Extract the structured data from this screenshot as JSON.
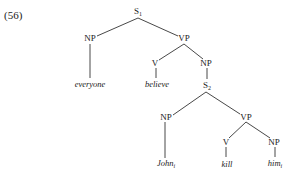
{
  "example_number": "(56)",
  "tree": {
    "nodes": [
      {
        "id": "S1",
        "label": "S",
        "sub": "1",
        "x": 138,
        "y": 12,
        "type": "cat"
      },
      {
        "id": "NP1",
        "label": "NP",
        "sub": "",
        "x": 90,
        "y": 38,
        "type": "cat"
      },
      {
        "id": "everyone",
        "label": "everyone",
        "sub": "",
        "x": 90,
        "y": 84,
        "type": "word"
      },
      {
        "id": "VP1",
        "label": "VP",
        "sub": "",
        "x": 184,
        "y": 38,
        "type": "cat"
      },
      {
        "id": "V1",
        "label": "V",
        "sub": "",
        "x": 155,
        "y": 63,
        "type": "cat"
      },
      {
        "id": "believe",
        "label": "believe",
        "sub": "",
        "x": 157,
        "y": 84,
        "type": "word"
      },
      {
        "id": "NP2",
        "label": "NP",
        "sub": "",
        "x": 206,
        "y": 63,
        "type": "cat"
      },
      {
        "id": "S2",
        "label": "S",
        "sub": "2",
        "x": 207,
        "y": 86,
        "type": "cat"
      },
      {
        "id": "NP3",
        "label": "NP",
        "sub": "",
        "x": 166,
        "y": 117,
        "type": "cat"
      },
      {
        "id": "John",
        "label": "John",
        "sub": "i",
        "x": 166,
        "y": 164,
        "type": "word"
      },
      {
        "id": "VP2",
        "label": "VP",
        "sub": "",
        "x": 246,
        "y": 117,
        "type": "cat"
      },
      {
        "id": "V2",
        "label": "V",
        "sub": "",
        "x": 226,
        "y": 142,
        "type": "cat"
      },
      {
        "id": "kill",
        "label": "kill",
        "sub": "",
        "x": 227,
        "y": 164,
        "type": "word"
      },
      {
        "id": "NP4",
        "label": "NP",
        "sub": "",
        "x": 274,
        "y": 142,
        "type": "cat"
      },
      {
        "id": "him",
        "label": "him",
        "sub": "i",
        "x": 275,
        "y": 164,
        "type": "word"
      }
    ],
    "edges": [
      {
        "from": "S1",
        "to": "NP1",
        "x1": 138,
        "y1": 18,
        "x2": 97,
        "y2": 36
      },
      {
        "from": "S1",
        "to": "VP1",
        "x1": 138,
        "y1": 18,
        "x2": 178,
        "y2": 36
      },
      {
        "from": "NP1",
        "to": "everyone",
        "x1": 90,
        "y1": 44,
        "x2": 90,
        "y2": 78
      },
      {
        "from": "VP1",
        "to": "V1",
        "x1": 184,
        "y1": 44,
        "x2": 159,
        "y2": 60
      },
      {
        "from": "VP1",
        "to": "NP2",
        "x1": 184,
        "y1": 44,
        "x2": 203,
        "y2": 59
      },
      {
        "from": "V1",
        "to": "believe",
        "x1": 156,
        "y1": 68,
        "x2": 156,
        "y2": 78
      },
      {
        "from": "NP2",
        "to": "S2",
        "x1": 207,
        "y1": 68,
        "x2": 207,
        "y2": 79
      },
      {
        "from": "S2",
        "to": "NP3",
        "x1": 206,
        "y1": 92,
        "x2": 173,
        "y2": 115
      },
      {
        "from": "S2",
        "to": "VP2",
        "x1": 206,
        "y1": 92,
        "x2": 240,
        "y2": 114
      },
      {
        "from": "NP3",
        "to": "John",
        "x1": 165,
        "y1": 122,
        "x2": 165,
        "y2": 158
      },
      {
        "from": "VP2",
        "to": "V2",
        "x1": 246,
        "y1": 122,
        "x2": 229,
        "y2": 138
      },
      {
        "from": "VP2",
        "to": "NP4",
        "x1": 246,
        "y1": 122,
        "x2": 270,
        "y2": 138
      },
      {
        "from": "V2",
        "to": "kill",
        "x1": 226,
        "y1": 147,
        "x2": 226,
        "y2": 157
      },
      {
        "from": "NP4",
        "to": "him",
        "x1": 275,
        "y1": 147,
        "x2": 275,
        "y2": 157
      }
    ]
  }
}
